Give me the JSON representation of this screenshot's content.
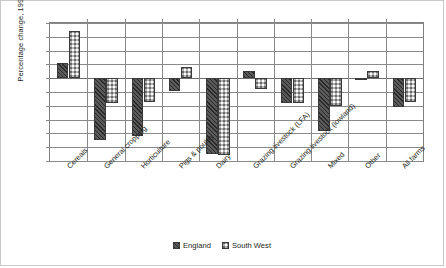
{
  "chart_data": {
    "type": "bar",
    "title": "",
    "xlabel": "",
    "ylabel": "Percentage change, 1995–2009",
    "ylim": [
      -60,
      40
    ],
    "ytick_step": 10,
    "yticks": [
      "40",
      "30",
      "20",
      "10",
      "0",
      "-10",
      "-20",
      "-30",
      "-40",
      "-50",
      "-60"
    ],
    "grid": true,
    "legend_position": "bottom",
    "categories": [
      "Cereals",
      "General cropping",
      "Horticulture",
      "Pigs & poultry",
      "Dairy",
      "Grazing livestock (LFA)",
      "Grazing livestock (lowland)",
      "Mixed",
      "Other",
      "All farms"
    ],
    "series": [
      {
        "name": "England",
        "pattern": "diagonal-hatch",
        "color": "#5a5a5a",
        "values": [
          11,
          -45,
          -42,
          -9,
          -55,
          5,
          -18,
          -38,
          -1,
          -21
        ]
      },
      {
        "name": "South West",
        "pattern": "checkerboard",
        "color": "#4a4a4a",
        "values": [
          34,
          -18,
          -17,
          8,
          -56,
          -8,
          -18,
          -20,
          5,
          -17
        ]
      }
    ]
  },
  "legend": {
    "items": [
      {
        "label": "England"
      },
      {
        "label": "South West"
      }
    ]
  }
}
